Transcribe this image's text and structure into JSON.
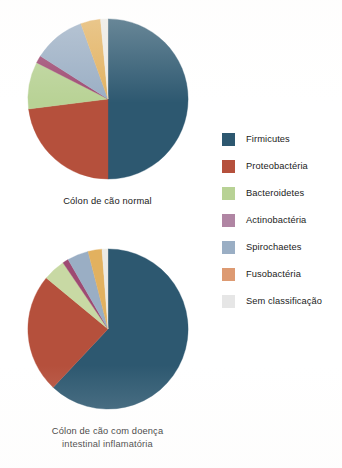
{
  "figure": {
    "background_color": "#ffffff"
  },
  "legend": {
    "name": "Filo bacteriano",
    "position": "right",
    "items": [
      {
        "label": "Firmicutes",
        "color": "#2d5870"
      },
      {
        "label": "Proteobactéria",
        "color": "#b5503c"
      },
      {
        "label": "Bacteroidetes",
        "color": "#b8d295"
      },
      {
        "label": "Actinobactéria",
        "color": "#b085a3"
      },
      {
        "label": "Spirochaetes",
        "color": "#9aaec4"
      },
      {
        "label": "Fusobactéria",
        "color": "#dd9a72"
      },
      {
        "label": "Sem classificação",
        "color": "#e6e6e6"
      }
    ]
  },
  "charts": [
    {
      "id": "pie-normal",
      "caption": "Cólon de cão normal",
      "caption_lines": [
        "Cólon de cão normal"
      ]
    },
    {
      "id": "pie-ibd",
      "caption": "Cólon de cão com doença intestinal inflamatória",
      "caption_lines": [
        "Cólon de cão com doença",
        "intestinal inflamatória"
      ]
    }
  ],
  "chart_data": [
    {
      "type": "pie",
      "id": "pie-normal",
      "title": "Cólon de cão normal",
      "start_angle": 0,
      "direction": "clockwise",
      "labels": [
        "Firmicutes",
        "Proteobactéria",
        "Bacteroidetes",
        "Actinobactéria",
        "Spirochaetes",
        "Fusobactéria",
        "Sem classificação"
      ],
      "values": [
        50.0,
        23.0,
        9.5,
        1.5,
        10.5,
        4.0,
        1.5
      ],
      "unit": "percent",
      "colors": [
        "#2d5870",
        "#b5503c",
        "#b8d295",
        "#9e4a72",
        "#9aaec4",
        "#e2b15f",
        "#eceae4"
      ],
      "legend_position": "right",
      "grid": false
    },
    {
      "type": "pie",
      "id": "pie-ibd",
      "title": "Cólon de cão com doença intestinal inflamatória",
      "start_angle": 0,
      "direction": "clockwise",
      "labels": [
        "Firmicutes",
        "Proteobactéria",
        "Bacteroidetes",
        "Actinobactéria",
        "Spirochaetes",
        "Fusobactéria",
        "Sem classificação"
      ],
      "values": [
        62.0,
        24.0,
        4.5,
        1.2,
        4.3,
        2.8,
        1.2
      ],
      "unit": "percent",
      "colors": [
        "#2d5870",
        "#b5503c",
        "#c8d9a4",
        "#9e4a72",
        "#9aaec4",
        "#e2b15f",
        "#eceae4"
      ],
      "legend_position": "right",
      "grid": false
    }
  ]
}
